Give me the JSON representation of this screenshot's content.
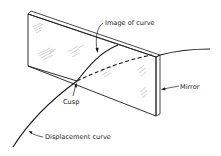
{
  "diagram": {
    "labels": {
      "image_of_curve": "Image of curve",
      "mirror": "Mirror",
      "cusp": "Cusp",
      "displacement_curve": "Displacement curve"
    },
    "colors": {
      "ink": "#1a1a1a",
      "background": "#ffffff",
      "hatch": "#8a8a8a"
    }
  }
}
